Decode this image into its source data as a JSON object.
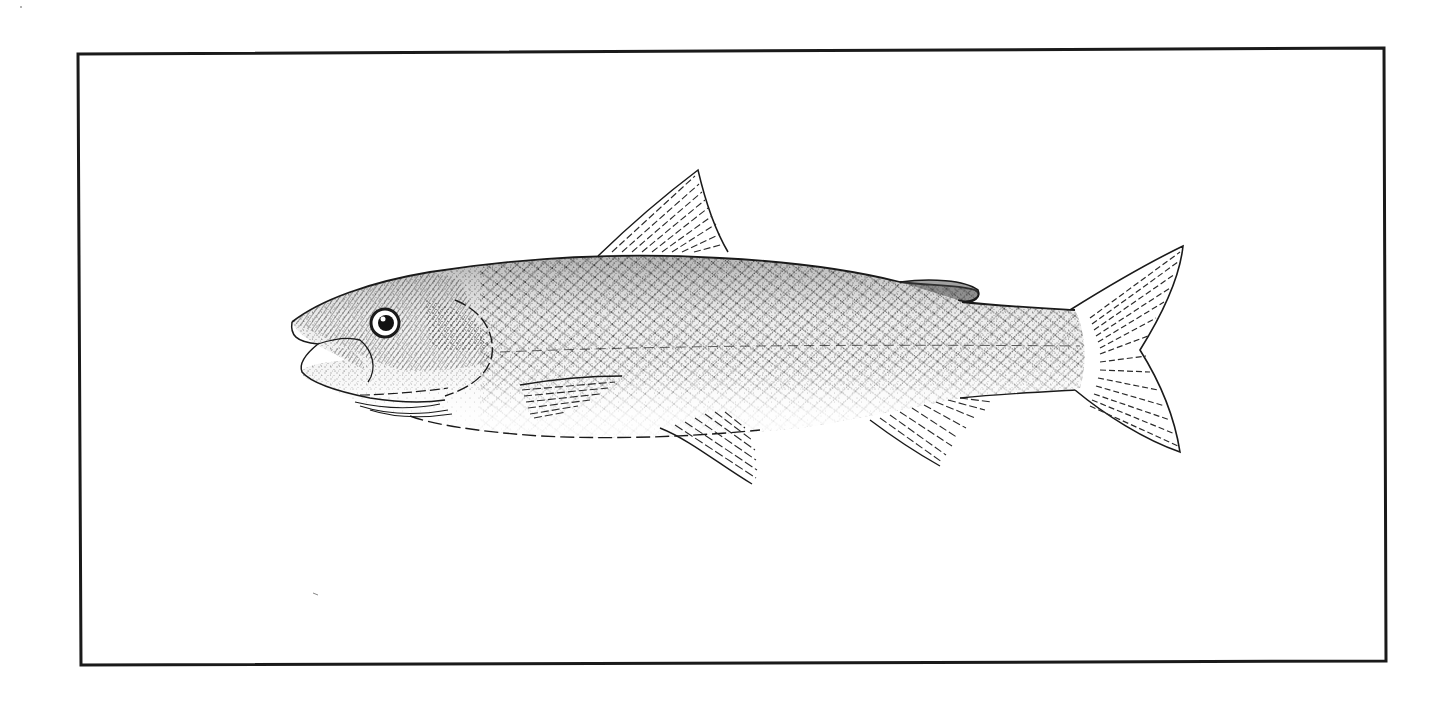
{
  "illustration": {
    "subject": "fish-side-view-engraving",
    "style": "black-and-white stipple and line engraving",
    "border": {
      "color": "#1a1a1a",
      "width": 3
    },
    "colors": {
      "ink": "#1a1a1a",
      "paper": "#ffffff",
      "shade": "#555555"
    },
    "parts": [
      "head",
      "eye",
      "mouth",
      "operculum",
      "body-scales",
      "lateral-line",
      "dorsal-fin",
      "adipose-fin",
      "pectoral-fin",
      "pelvic-fin",
      "anal-fin",
      "caudal-fin"
    ]
  }
}
